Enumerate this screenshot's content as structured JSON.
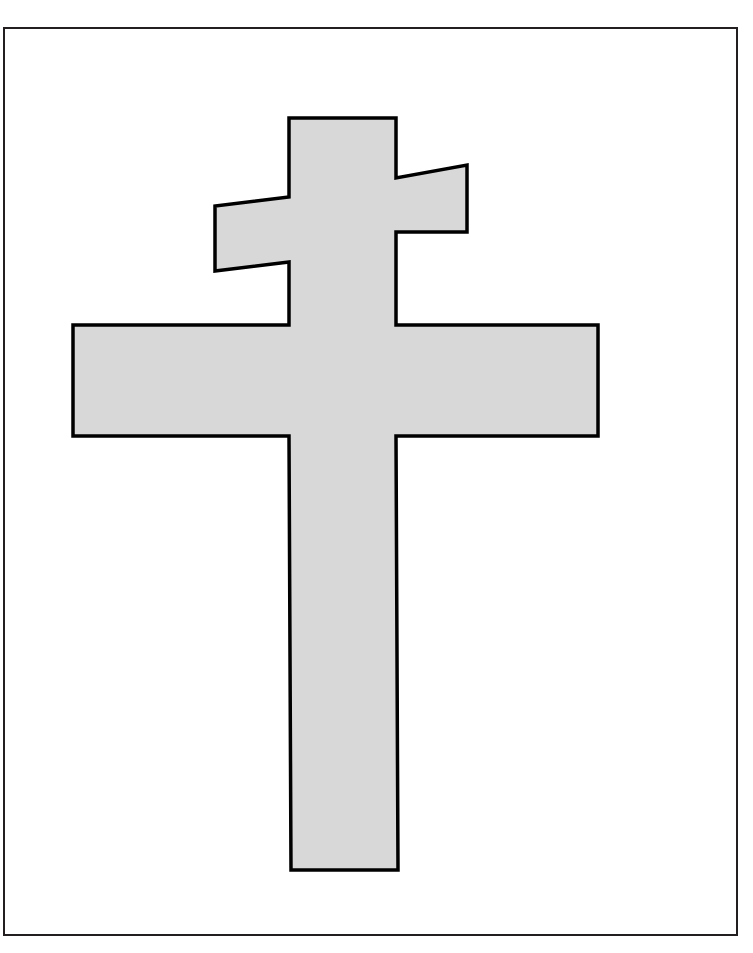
{
  "page": {
    "width": 753,
    "height": 953,
    "background_color": "#ffffff"
  },
  "frame": {
    "name": "image-border-frame",
    "stroke_color": "#231f20",
    "stroke_width": 2,
    "fill_color": "#ffffff",
    "x": 4,
    "y": 28,
    "width": 733,
    "height": 907
  },
  "shape": {
    "name": "patriarchal-cross",
    "description": "Two-barred cross with a slanted upper crossbar and a wide horizontal main crossbar over a long vertical beam",
    "fill_color": "#d8d8d8",
    "stroke_color": "#000000",
    "stroke_width": 3.5,
    "points": "289,118 396,118 396,178 467,165 467,232 396,232 396,325 598,325 598,436 396,436 398,870 291,870 289,436 73,436 73,325 289,325 289,262 215,271 215,206 289,197",
    "vertices": [
      {
        "label": "beam-top-left",
        "x": 289,
        "y": 118
      },
      {
        "label": "beam-top-right",
        "x": 396,
        "y": 118
      },
      {
        "label": "upper-bar-right-inner-top",
        "x": 396,
        "y": 178
      },
      {
        "label": "upper-bar-right-tip-top",
        "x": 467,
        "y": 165
      },
      {
        "label": "upper-bar-right-tip-bottom",
        "x": 467,
        "y": 232
      },
      {
        "label": "upper-bar-right-inner-bottom",
        "x": 396,
        "y": 232
      },
      {
        "label": "main-bar-right-inner-top",
        "x": 396,
        "y": 325
      },
      {
        "label": "main-bar-right-outer-top",
        "x": 598,
        "y": 325
      },
      {
        "label": "main-bar-right-outer-bottom",
        "x": 598,
        "y": 436
      },
      {
        "label": "main-bar-right-inner-bottom",
        "x": 396,
        "y": 436
      },
      {
        "label": "beam-bottom-right",
        "x": 398,
        "y": 870
      },
      {
        "label": "beam-bottom-left",
        "x": 291,
        "y": 870
      },
      {
        "label": "main-bar-left-inner-bottom",
        "x": 289,
        "y": 436
      },
      {
        "label": "main-bar-left-outer-bottom",
        "x": 73,
        "y": 436
      },
      {
        "label": "main-bar-left-outer-top",
        "x": 73,
        "y": 325
      },
      {
        "label": "main-bar-left-inner-top",
        "x": 289,
        "y": 325
      },
      {
        "label": "upper-bar-left-inner-bottom",
        "x": 289,
        "y": 262
      },
      {
        "label": "upper-bar-left-tip-bottom",
        "x": 215,
        "y": 271
      },
      {
        "label": "upper-bar-left-tip-top",
        "x": 215,
        "y": 206
      },
      {
        "label": "upper-bar-left-inner-top",
        "x": 289,
        "y": 197
      }
    ],
    "parts": [
      {
        "name": "vertical-beam",
        "left": 289,
        "top": 118,
        "right": 398,
        "bottom": 870
      },
      {
        "name": "upper-crossbar",
        "left": 215,
        "right": 467,
        "left_top": 206,
        "left_bottom": 271,
        "right_top": 165,
        "right_bottom": 232,
        "slanted": true
      },
      {
        "name": "main-crossbar",
        "left": 73,
        "right": 598,
        "top": 325,
        "bottom": 436,
        "slanted": false
      }
    ]
  }
}
